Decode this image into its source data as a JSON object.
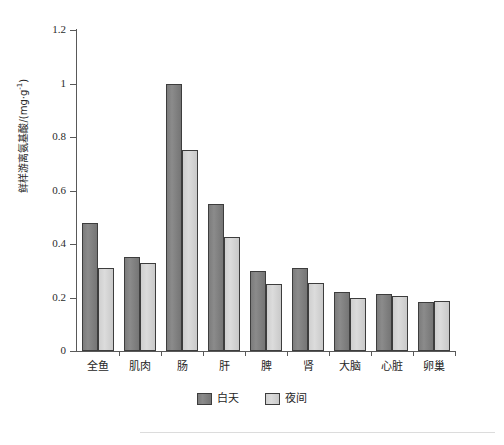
{
  "chart_data": {
    "type": "bar",
    "title": "",
    "xlabel": "",
    "ylabel": "鲜样游离氨基酸/(mg·g-1)",
    "ylabel_main": "鲜样游离氨基酸/(mg·g",
    "ylabel_sup": "-1",
    "ylabel_tail": ")",
    "categories": [
      "全鱼",
      "肌肉",
      "肠",
      "肝",
      "脾",
      "肾",
      "大脑",
      "心脏",
      "卵巢"
    ],
    "series": [
      {
        "name": "白天",
        "color": "#858585",
        "values": [
          0.48,
          0.35,
          1.0,
          0.55,
          0.3,
          0.31,
          0.22,
          0.215,
          0.185
        ]
      },
      {
        "name": "夜间",
        "color": "#d4d4d4",
        "values": [
          0.31,
          0.33,
          0.75,
          0.425,
          0.25,
          0.255,
          0.2,
          0.205,
          0.188
        ]
      }
    ],
    "ylim": [
      0,
      1.2
    ],
    "yticks": [
      0,
      0.2,
      0.4,
      0.6,
      0.8,
      1,
      1.2
    ],
    "ytick_labels": [
      "0",
      "0.2",
      "0.4",
      "0.6",
      "0.8",
      "1",
      "1.2"
    ],
    "grid": false,
    "legend_position": "bottom-center"
  },
  "legend": {
    "items": [
      {
        "label": "白天",
        "swatch": "day"
      },
      {
        "label": "夜间",
        "swatch": "night"
      }
    ]
  },
  "colors": {
    "day_bar": "#858585",
    "night_bar": "#d4d4d4",
    "bar_border": "#3d3d3d",
    "axis": "#595959",
    "text": "#262626",
    "background": "#ffffff",
    "bottom_rule": "#dcdcdc"
  }
}
